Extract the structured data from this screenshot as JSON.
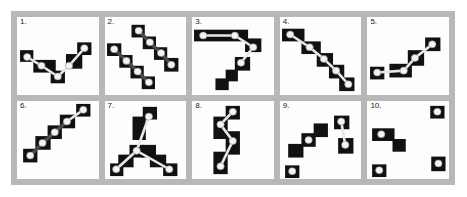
{
  "figure": {
    "title": "",
    "frame_color": "#b8b8b8",
    "panel_bg": "#fdfdfd",
    "box_color": "#111111",
    "node_color": "#f4f4f4",
    "edge_color": "#e8e8e8",
    "edge_dark_color": "#4a4a4a",
    "rows": 2,
    "cols": 5,
    "panel_count": 10
  },
  "panels": [
    {
      "id": 1,
      "label": "1.",
      "description": "valley-shaped chain of five boxes descending then ascending left to right",
      "boxes": [
        {
          "x": 3,
          "y": 34,
          "w": 13,
          "h": 12
        },
        {
          "x": 16,
          "y": 44,
          "w": 22,
          "h": 13
        },
        {
          "x": 33,
          "y": 55,
          "w": 14,
          "h": 13
        },
        {
          "x": 48,
          "y": 38,
          "w": 16,
          "h": 15
        },
        {
          "x": 59,
          "y": 26,
          "w": 14,
          "h": 13
        }
      ],
      "nodes": [
        {
          "x": 10,
          "y": 41
        },
        {
          "x": 24,
          "y": 50
        },
        {
          "x": 40,
          "y": 61
        },
        {
          "x": 51,
          "y": 50
        },
        {
          "x": 66,
          "y": 32
        }
      ],
      "edges": [
        [
          0,
          1
        ],
        [
          1,
          2
        ],
        [
          2,
          3
        ],
        [
          3,
          4
        ]
      ],
      "edge_style": [
        "light",
        "light",
        "light",
        "light"
      ]
    },
    {
      "id": 2,
      "label": "2.",
      "description": "two parallel descending diagonal chains of dark boxes",
      "boxes": [
        {
          "x": 26,
          "y": 8,
          "w": 13,
          "h": 13
        },
        {
          "x": 37,
          "y": 20,
          "w": 13,
          "h": 13
        },
        {
          "x": 48,
          "y": 31,
          "w": 13,
          "h": 13
        },
        {
          "x": 58,
          "y": 42,
          "w": 14,
          "h": 14
        },
        {
          "x": 2,
          "y": 27,
          "w": 14,
          "h": 13
        },
        {
          "x": 14,
          "y": 39,
          "w": 13,
          "h": 13
        },
        {
          "x": 25,
          "y": 50,
          "w": 13,
          "h": 13
        },
        {
          "x": 36,
          "y": 61,
          "w": 13,
          "h": 13
        }
      ],
      "nodes": [
        {
          "x": 33,
          "y": 14
        },
        {
          "x": 44,
          "y": 26
        },
        {
          "x": 55,
          "y": 37
        },
        {
          "x": 65,
          "y": 49
        },
        {
          "x": 9,
          "y": 33
        },
        {
          "x": 21,
          "y": 45
        },
        {
          "x": 32,
          "y": 56
        },
        {
          "x": 43,
          "y": 67
        }
      ],
      "edges": [
        [
          0,
          1
        ],
        [
          1,
          2
        ],
        [
          2,
          3
        ],
        [
          4,
          5
        ],
        [
          5,
          6
        ],
        [
          6,
          7
        ]
      ],
      "edge_style": [
        "dark",
        "dark",
        "dark",
        "dark",
        "dark",
        "dark"
      ]
    },
    {
      "id": 3,
      "label": "3.",
      "description": "wide horizontal bar at top with two nodes, then chain descending to lower-left",
      "boxes": [
        {
          "x": 2,
          "y": 13,
          "w": 53,
          "h": 12
        },
        {
          "x": 52,
          "y": 22,
          "w": 16,
          "h": 14
        },
        {
          "x": 42,
          "y": 41,
          "w": 15,
          "h": 14
        },
        {
          "x": 33,
          "y": 54,
          "w": 12,
          "h": 12
        },
        {
          "x": 23,
          "y": 63,
          "w": 13,
          "h": 12
        }
      ],
      "nodes": [
        {
          "x": 11,
          "y": 19
        },
        {
          "x": 42,
          "y": 19
        },
        {
          "x": 60,
          "y": 31
        },
        {
          "x": 48,
          "y": 47
        }
      ],
      "edges": [
        [
          0,
          1
        ],
        [
          1,
          2
        ],
        [
          2,
          3
        ]
      ],
      "edge_style": [
        "light",
        "light",
        "light"
      ]
    },
    {
      "id": 4,
      "label": "4.",
      "description": "descending staircase chain from upper-left to lower-right",
      "boxes": [
        {
          "x": 2,
          "y": 12,
          "w": 22,
          "h": 13
        },
        {
          "x": 21,
          "y": 25,
          "w": 19,
          "h": 13
        },
        {
          "x": 36,
          "y": 37,
          "w": 16,
          "h": 14
        },
        {
          "x": 48,
          "y": 49,
          "w": 15,
          "h": 14
        },
        {
          "x": 58,
          "y": 62,
          "w": 15,
          "h": 14
        }
      ],
      "nodes": [
        {
          "x": 10,
          "y": 18
        },
        {
          "x": 29,
          "y": 31
        },
        {
          "x": 43,
          "y": 43
        },
        {
          "x": 55,
          "y": 55
        },
        {
          "x": 67,
          "y": 69
        }
      ],
      "edges": [
        [
          0,
          1
        ],
        [
          1,
          2
        ],
        [
          2,
          3
        ],
        [
          3,
          4
        ]
      ],
      "edge_style": [
        "light",
        "light",
        "light",
        "light"
      ]
    },
    {
      "id": 5,
      "label": "5.",
      "description": "flat segment at lower-left rising to upper-right",
      "boxes": [
        {
          "x": 3,
          "y": 51,
          "w": 14,
          "h": 13
        },
        {
          "x": 22,
          "y": 48,
          "w": 22,
          "h": 14
        },
        {
          "x": 40,
          "y": 34,
          "w": 16,
          "h": 16
        },
        {
          "x": 57,
          "y": 21,
          "w": 15,
          "h": 14
        }
      ],
      "nodes": [
        {
          "x": 10,
          "y": 57
        },
        {
          "x": 36,
          "y": 55
        },
        {
          "x": 47,
          "y": 42
        },
        {
          "x": 64,
          "y": 28
        }
      ],
      "edges": [
        [
          0,
          1
        ],
        [
          1,
          2
        ],
        [
          2,
          3
        ]
      ],
      "edge_style": [
        "light",
        "light",
        "light"
      ]
    },
    {
      "id": 6,
      "label": "6.",
      "description": "ascending diagonal chain from lower-left to upper-right",
      "boxes": [
        {
          "x": 6,
          "y": 49,
          "w": 14,
          "h": 14
        },
        {
          "x": 18,
          "y": 36,
          "w": 15,
          "h": 14
        },
        {
          "x": 30,
          "y": 25,
          "w": 14,
          "h": 14
        },
        {
          "x": 42,
          "y": 14,
          "w": 15,
          "h": 14
        },
        {
          "x": 58,
          "y": 3,
          "w": 14,
          "h": 13
        }
      ],
      "nodes": [
        {
          "x": 13,
          "y": 56
        },
        {
          "x": 25,
          "y": 43
        },
        {
          "x": 37,
          "y": 32
        },
        {
          "x": 49,
          "y": 21
        },
        {
          "x": 65,
          "y": 9
        }
      ],
      "edges": [
        [
          0,
          1
        ],
        [
          1,
          2
        ],
        [
          2,
          3
        ],
        [
          3,
          4
        ]
      ],
      "edge_style": [
        "dark",
        "dark",
        "dark",
        "light"
      ]
    },
    {
      "id": 7,
      "label": "7.",
      "description": "inverted-V peak with two legs descending to lower corners",
      "boxes": [
        {
          "x": 37,
          "y": 6,
          "w": 14,
          "h": 13
        },
        {
          "x": 27,
          "y": 16,
          "w": 13,
          "h": 24
        },
        {
          "x": 24,
          "y": 45,
          "w": 14,
          "h": 13
        },
        {
          "x": 36,
          "y": 45,
          "w": 14,
          "h": 13
        },
        {
          "x": 13,
          "y": 55,
          "w": 15,
          "h": 13
        },
        {
          "x": 44,
          "y": 55,
          "w": 16,
          "h": 13
        },
        {
          "x": 5,
          "y": 64,
          "w": 13,
          "h": 13
        },
        {
          "x": 57,
          "y": 64,
          "w": 14,
          "h": 13
        }
      ],
      "nodes": [
        {
          "x": 43,
          "y": 16
        },
        {
          "x": 31,
          "y": 51
        },
        {
          "x": 11,
          "y": 70
        },
        {
          "x": 63,
          "y": 70
        }
      ],
      "edges": [
        [
          0,
          1
        ],
        [
          1,
          2
        ],
        [
          1,
          3
        ]
      ],
      "edge_style": [
        "light",
        "light",
        "light"
      ]
    },
    {
      "id": 8,
      "label": "8.",
      "description": "vertical zigzag chain of tall boxes descending down the middle",
      "boxes": [
        {
          "x": 33,
          "y": 5,
          "w": 14,
          "h": 14
        },
        {
          "x": 21,
          "y": 16,
          "w": 14,
          "h": 23
        },
        {
          "x": 33,
          "y": 31,
          "w": 14,
          "h": 24
        },
        {
          "x": 21,
          "y": 52,
          "w": 14,
          "h": 23
        }
      ],
      "nodes": [
        {
          "x": 40,
          "y": 11
        },
        {
          "x": 28,
          "y": 24
        },
        {
          "x": 40,
          "y": 41
        },
        {
          "x": 28,
          "y": 67
        }
      ],
      "edges": [
        [
          0,
          1
        ],
        [
          1,
          2
        ],
        [
          2,
          3
        ]
      ],
      "edge_style": [
        "light",
        "light",
        "light"
      ]
    },
    {
      "id": 9,
      "label": "9.",
      "description": "ascending staircase at left plus a separate vertical pair at right",
      "boxes": [
        {
          "x": 8,
          "y": 44,
          "w": 15,
          "h": 14
        },
        {
          "x": 21,
          "y": 33,
          "w": 14,
          "h": 14
        },
        {
          "x": 33,
          "y": 23,
          "w": 14,
          "h": 14
        },
        {
          "x": 5,
          "y": 66,
          "w": 14,
          "h": 13
        },
        {
          "x": 53,
          "y": 15,
          "w": 15,
          "h": 14
        },
        {
          "x": 57,
          "y": 38,
          "w": 15,
          "h": 16
        }
      ],
      "nodes": [
        {
          "x": 28,
          "y": 40
        },
        {
          "x": 12,
          "y": 72
        },
        {
          "x": 60,
          "y": 21
        },
        {
          "x": 64,
          "y": 45
        }
      ],
      "edges": [
        [
          2,
          3
        ]
      ],
      "edge_style": [
        "light"
      ]
    },
    {
      "id": 10,
      "label": "10.",
      "description": "four isolated boxes with nodes, no connecting edges",
      "boxes": [
        {
          "x": 5,
          "y": 28,
          "w": 22,
          "h": 13
        },
        {
          "x": 25,
          "y": 39,
          "w": 13,
          "h": 13
        },
        {
          "x": 62,
          "y": 5,
          "w": 14,
          "h": 13
        },
        {
          "x": 63,
          "y": 57,
          "w": 14,
          "h": 15
        },
        {
          "x": 5,
          "y": 65,
          "w": 14,
          "h": 13
        }
      ],
      "nodes": [
        {
          "x": 14,
          "y": 34
        },
        {
          "x": 69,
          "y": 11
        },
        {
          "x": 70,
          "y": 64
        },
        {
          "x": 12,
          "y": 71
        }
      ],
      "edges": [],
      "edge_style": []
    }
  ]
}
